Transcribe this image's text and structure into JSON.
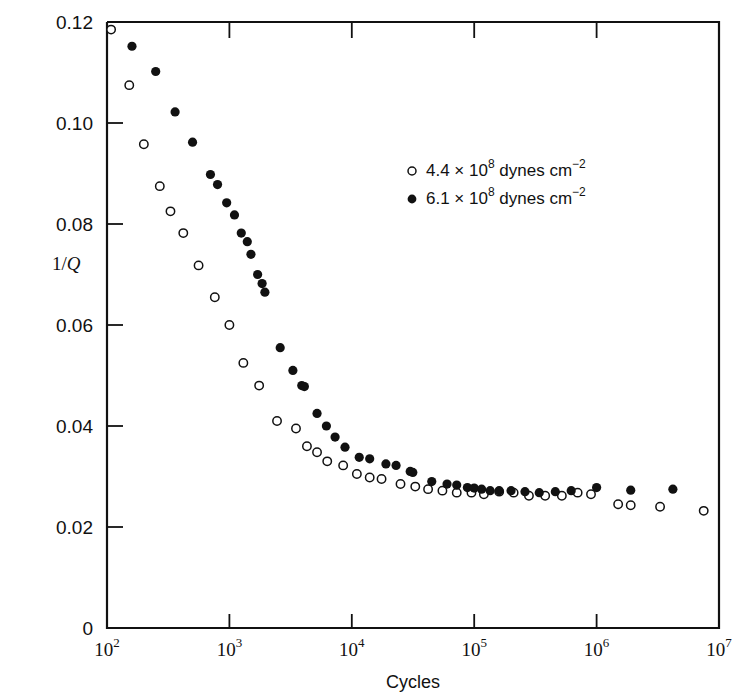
{
  "figure": {
    "background": "#ffffff",
    "ink_color": "#111111"
  },
  "chart_data": {
    "type": "scatter",
    "title": "",
    "subtitle": "",
    "xlabel": "Cycles",
    "ylabel": "1/Q",
    "xscale": "log",
    "yscale": "linear",
    "xlim": [
      100,
      10000000
    ],
    "ylim": [
      0,
      0.12
    ],
    "grid": false,
    "legend_position": "upper-right-inside",
    "xticks": [
      {
        "value": 100,
        "label": "10",
        "exponent": "2"
      },
      {
        "value": 1000,
        "label": "10",
        "exponent": "3"
      },
      {
        "value": 10000,
        "label": "10",
        "exponent": "4"
      },
      {
        "value": 100000,
        "label": "10",
        "exponent": "5"
      },
      {
        "value": 1000000,
        "label": "10",
        "exponent": "6"
      },
      {
        "value": 10000000,
        "label": "10",
        "exponent": "7"
      }
    ],
    "yticks": [
      {
        "value": 0,
        "label": "0"
      },
      {
        "value": 0.02,
        "label": "0.02"
      },
      {
        "value": 0.04,
        "label": "0.04"
      },
      {
        "value": 0.06,
        "label": "0.06"
      },
      {
        "value": 0.08,
        "label": "0.08"
      },
      {
        "value": 0.1,
        "label": "0.10"
      },
      {
        "value": 0.12,
        "label": "0.12"
      }
    ],
    "series": [
      {
        "name": "4.4 × 10^8 dynes cm^-2",
        "legend_label_parts": {
          "mantissa": "4.4 × 10",
          "exponent": "8",
          "unit": " dynes cm",
          "unit_exponent": "−2"
        },
        "marker": "open-circle",
        "color": "#111111",
        "points": [
          [
            108,
            0.1185
          ],
          [
            152,
            0.1075
          ],
          [
            200,
            0.0958
          ],
          [
            270,
            0.0875
          ],
          [
            330,
            0.0825
          ],
          [
            420,
            0.0782
          ],
          [
            560,
            0.0718
          ],
          [
            760,
            0.0655
          ],
          [
            1000,
            0.06
          ],
          [
            1300,
            0.0525
          ],
          [
            1750,
            0.048
          ],
          [
            2450,
            0.041
          ],
          [
            3500,
            0.0395
          ],
          [
            4300,
            0.036
          ],
          [
            5200,
            0.0348
          ],
          [
            6300,
            0.033
          ],
          [
            8500,
            0.0322
          ],
          [
            11000,
            0.0305
          ],
          [
            14000,
            0.0298
          ],
          [
            17500,
            0.0295
          ],
          [
            25000,
            0.0285
          ],
          [
            33000,
            0.028
          ],
          [
            42000,
            0.0275
          ],
          [
            55000,
            0.0272
          ],
          [
            72000,
            0.0268
          ],
          [
            95000,
            0.0268
          ],
          [
            120000,
            0.0265
          ],
          [
            160000,
            0.027
          ],
          [
            210000,
            0.0268
          ],
          [
            280000,
            0.0262
          ],
          [
            380000,
            0.0262
          ],
          [
            520000,
            0.0262
          ],
          [
            700000,
            0.0268
          ],
          [
            900000,
            0.0265
          ],
          [
            1500000,
            0.0245
          ],
          [
            1900000,
            0.0243
          ],
          [
            3300000,
            0.024
          ],
          [
            7500000,
            0.0232
          ]
        ]
      },
      {
        "name": "6.1 × 10^8 dynes cm^-2",
        "legend_label_parts": {
          "mantissa": "6.1 × 10",
          "exponent": "8",
          "unit": " dynes cm",
          "unit_exponent": "−2"
        },
        "marker": "filled-circle",
        "color": "#111111",
        "points": [
          [
            160,
            0.1152
          ],
          [
            250,
            0.1102
          ],
          [
            360,
            0.1022
          ],
          [
            500,
            0.0962
          ],
          [
            700,
            0.0898
          ],
          [
            800,
            0.0878
          ],
          [
            950,
            0.0842
          ],
          [
            1100,
            0.0818
          ],
          [
            1250,
            0.0782
          ],
          [
            1400,
            0.0765
          ],
          [
            1500,
            0.074
          ],
          [
            1700,
            0.07
          ],
          [
            1850,
            0.0682
          ],
          [
            1950,
            0.0665
          ],
          [
            2600,
            0.0555
          ],
          [
            3300,
            0.051
          ],
          [
            3900,
            0.048
          ],
          [
            4100,
            0.0478
          ],
          [
            5200,
            0.0425
          ],
          [
            6200,
            0.04
          ],
          [
            7300,
            0.0378
          ],
          [
            8800,
            0.0358
          ],
          [
            11500,
            0.0338
          ],
          [
            14000,
            0.0335
          ],
          [
            19000,
            0.0325
          ],
          [
            23000,
            0.0322
          ],
          [
            30000,
            0.031
          ],
          [
            31500,
            0.0308
          ],
          [
            45000,
            0.029
          ],
          [
            60000,
            0.0285
          ],
          [
            72000,
            0.0283
          ],
          [
            88000,
            0.0278
          ],
          [
            100000,
            0.0277
          ],
          [
            115000,
            0.0275
          ],
          [
            135000,
            0.0272
          ],
          [
            160000,
            0.0272
          ],
          [
            200000,
            0.0272
          ],
          [
            260000,
            0.027
          ],
          [
            340000,
            0.0268
          ],
          [
            460000,
            0.027
          ],
          [
            620000,
            0.0272
          ],
          [
            1000000,
            0.0278
          ],
          [
            1900000,
            0.0273
          ],
          [
            4200000,
            0.0275
          ]
        ]
      }
    ]
  }
}
